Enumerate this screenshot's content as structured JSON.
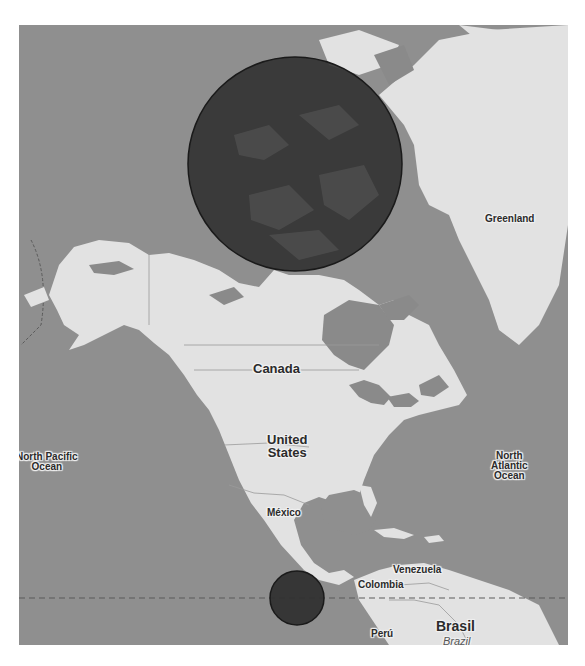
{
  "map": {
    "colors": {
      "ocean": "#8f8f8f",
      "land": "#e2e2e2",
      "water_inland": "#8a8a8a",
      "circle_fill": "#3a3a3a",
      "circle_stroke": "#1e1e1e",
      "equator": "#5a5a5a"
    },
    "labels": {
      "greenland": "Greenland",
      "canada": "Canada",
      "united_states_line1": "United",
      "united_states_line2": "States",
      "north_pacific_line1": "North Pacific",
      "north_pacific_line2": "Ocean",
      "north_atlantic_line1": "North",
      "north_atlantic_line2": "Atlantic",
      "north_atlantic_line3": "Ocean",
      "mexico": "México",
      "venezuela": "Venezuela",
      "colombia": "Colombia",
      "peru": "Perú",
      "brasil": "Brasil",
      "brazil": "Brazil"
    },
    "overlays": [
      {
        "type": "circle",
        "name": "large-circle",
        "cx": 276,
        "cy": 139,
        "r": 107
      },
      {
        "type": "circle",
        "name": "small-circle",
        "cx": 278,
        "cy": 573,
        "r": 27
      }
    ],
    "equator_line": {
      "y": 573,
      "style": "dashed"
    }
  }
}
